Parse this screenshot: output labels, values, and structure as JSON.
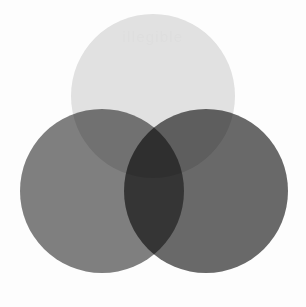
{
  "figure": {
    "background_color": "#fdfdfd",
    "width": 306,
    "height": 307
  },
  "watermark": {
    "text": "illegible",
    "color": "#dcdcdc",
    "opacity": 0.55,
    "note": "faint light-gray watermark inside top circle, not legible at source resolution"
  },
  "chart_data": {
    "type": "venn",
    "xlabel": "",
    "ylabel": "",
    "grid": false,
    "legend": "none",
    "blend_mode": "multiply",
    "background_color": "#fdfdfd",
    "canvas": {
      "width": 306,
      "height": 307
    },
    "sets": [
      {
        "name": "top-circle",
        "label": "A",
        "cx": 153,
        "cy": 96,
        "r": 82,
        "color": "#e3e3e3",
        "opacity": 1
      },
      {
        "name": "left-circle",
        "label": "B",
        "cx": 102,
        "cy": 191,
        "r": 82,
        "color": "#808080",
        "opacity": 1
      },
      {
        "name": "right-circle",
        "label": "C",
        "cx": 206,
        "cy": 191,
        "r": 82,
        "color": "#6a6a6a",
        "opacity": 1
      }
    ],
    "region_colors": [
      {
        "region": "A only",
        "color": "#e3e3e3"
      },
      {
        "region": "B only",
        "color": "#808080"
      },
      {
        "region": "C only",
        "color": "#6a6a6a"
      },
      {
        "region": "A and B",
        "color": "#595959"
      },
      {
        "region": "A and C",
        "color": "#4b4b4b"
      },
      {
        "region": "B and C",
        "color": "#2e2e2e"
      },
      {
        "region": "A and B and C",
        "color": "#000000"
      }
    ]
  }
}
